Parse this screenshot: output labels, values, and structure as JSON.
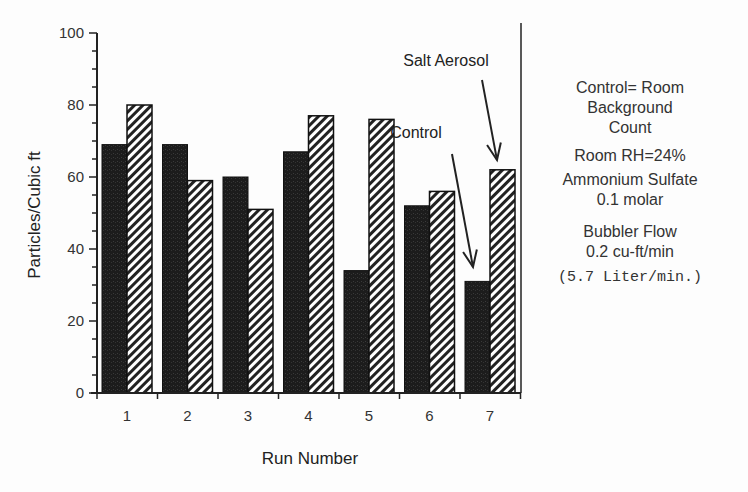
{
  "chart_data": {
    "type": "bar",
    "title": "",
    "xlabel": "Run Number",
    "ylabel": "Particles/Cubic ft",
    "ylim": [
      0,
      100
    ],
    "yticks": [
      0,
      20,
      40,
      60,
      80,
      100
    ],
    "categories": [
      "1",
      "2",
      "3",
      "4",
      "5",
      "6",
      "7"
    ],
    "series": [
      {
        "name": "Control",
        "pattern": "solid-dark",
        "values": [
          69,
          69,
          60,
          67,
          34,
          52,
          31
        ]
      },
      {
        "name": "Salt Aerosol",
        "pattern": "diagonal-hatch",
        "values": [
          80,
          59,
          51,
          77,
          76,
          56,
          62
        ]
      }
    ],
    "annotations": [
      {
        "text": "Salt Aerosol",
        "points_to": "run 7 salt aerosol bar"
      },
      {
        "text": "Control",
        "points_to": "run 7 control bar"
      }
    ],
    "grid": false,
    "legend": "none (arrow annotations)"
  },
  "notes": {
    "line1": "Control= Room",
    "line2": "Background",
    "line3": "Count",
    "line4": "Room  RH=24%",
    "line5": "Ammonium Sulfate",
    "line6": "0.1 molar",
    "line7": "Bubbler Flow",
    "line8": "0.2 cu-ft/min",
    "line9": "(5.7 Liter/min.)"
  }
}
